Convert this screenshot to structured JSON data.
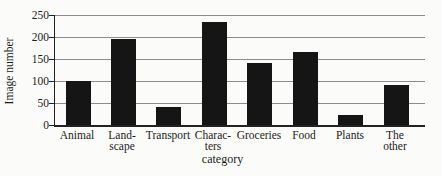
{
  "figure": {
    "background": "#fbfbf9"
  },
  "chart_data": {
    "type": "bar",
    "title": "",
    "xlabel": "category",
    "ylabel": "Image number",
    "categories": [
      "Animal",
      "Landscape",
      "Transport",
      "Characters",
      "Groceries",
      "Food",
      "Plants",
      "The other"
    ],
    "category_display_lines": [
      [
        "Animal"
      ],
      [
        "Land-",
        "scape"
      ],
      [
        "Transport"
      ],
      [
        "Charac-",
        "ters"
      ],
      [
        "Groceries"
      ],
      [
        "Food"
      ],
      [
        "Plants"
      ],
      [
        "The",
        "other"
      ]
    ],
    "values": [
      100,
      195,
      42,
      235,
      140,
      165,
      23,
      90
    ],
    "ylim": [
      0,
      250
    ],
    "yticks": [
      0,
      50,
      100,
      150,
      200,
      250
    ],
    "grid": "horizontal",
    "legend": "none",
    "colors": {
      "bar": "#151515",
      "gridline": "#8c8c8c",
      "axis": "#222222",
      "text": "#1c1c1c",
      "background": "#fbfbf9"
    }
  }
}
